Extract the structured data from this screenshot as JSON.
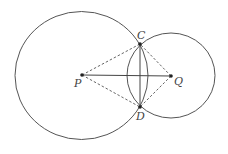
{
  "diagram": {
    "type": "geometry",
    "points": {
      "P": {
        "label": "P",
        "x": 82,
        "y": 75
      },
      "Q": {
        "label": "Q",
        "x": 171,
        "y": 76
      },
      "C": {
        "label": "C",
        "x": 140,
        "y": 44
      },
      "D": {
        "label": "D",
        "x": 140,
        "y": 107
      }
    },
    "circles": [
      {
        "name": "circle-P",
        "center": "P",
        "cx": 81.5,
        "cy": 75.5,
        "rx": 66.5,
        "ry": 64
      },
      {
        "name": "circle-Q",
        "center": "Q",
        "cx": 171,
        "cy": 75.5,
        "rx": 44,
        "ry": 42.5
      }
    ],
    "segments": [
      {
        "from": "P",
        "to": "Q",
        "style": "solid"
      },
      {
        "from": "C",
        "to": "D",
        "style": "solid"
      },
      {
        "from": "P",
        "to": "C",
        "style": "dashed"
      },
      {
        "from": "P",
        "to": "D",
        "style": "dashed"
      },
      {
        "from": "Q",
        "to": "C",
        "style": "dashed"
      },
      {
        "from": "Q",
        "to": "D",
        "style": "dashed"
      }
    ],
    "colors": {
      "stroke": "#555555",
      "point": "#222222"
    }
  }
}
